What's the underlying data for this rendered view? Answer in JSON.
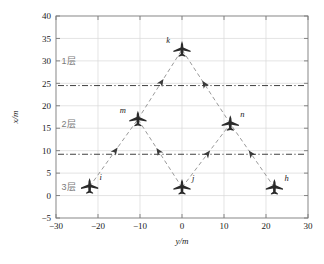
{
  "chart_data": {
    "type": "scatter",
    "title": "",
    "xlabel": "y/m",
    "ylabel": "x/m",
    "xlim": [
      -30,
      30
    ],
    "ylim": [
      -5,
      40
    ],
    "xticks": [
      -30,
      -20,
      -10,
      0,
      10,
      20,
      30
    ],
    "xticklabels": [
      "−30",
      "−20",
      "−10",
      "0",
      "10",
      "20",
      "30"
    ],
    "yticks": [
      -5,
      0,
      5,
      10,
      15,
      20,
      25,
      30,
      35,
      40
    ],
    "yticklabels": [
      "−5",
      "0",
      "5",
      "10",
      "15",
      "20",
      "25",
      "30",
      "35",
      "40"
    ],
    "grid": true,
    "legend": "none",
    "aircraft": [
      {
        "id": "k",
        "label": "k",
        "y": 0.0,
        "x": 32.5,
        "layer": 1,
        "label_side": "left"
      },
      {
        "id": "m",
        "label": "m",
        "y": -10.5,
        "x": 17.0,
        "layer": 2,
        "label_side": "left"
      },
      {
        "id": "n",
        "label": "n",
        "y": 11.5,
        "x": 16.0,
        "layer": 2,
        "label_side": "right"
      },
      {
        "id": "i",
        "label": "i",
        "y": -22.0,
        "x": 2.0,
        "layer": 3,
        "label_side": "right"
      },
      {
        "id": "j",
        "label": "j",
        "y": 0.0,
        "x": 1.8,
        "layer": 3,
        "label_side": "right"
      },
      {
        "id": "h",
        "label": "h",
        "y": 22.0,
        "x": 1.8,
        "layer": 3,
        "label_side": "right"
      }
    ],
    "trajectories": [
      {
        "from": "i",
        "to": "m"
      },
      {
        "from": "j",
        "to": "m"
      },
      {
        "from": "j",
        "to": "n"
      },
      {
        "from": "h",
        "to": "n"
      },
      {
        "from": "m",
        "to": "k"
      },
      {
        "from": "n",
        "to": "k"
      }
    ],
    "reference_lines": [
      {
        "name": "layer-1-2-boundary",
        "x": 24.5,
        "style": "dash-dot",
        "color": "#2b2b2b"
      },
      {
        "name": "layer-2-3-boundary",
        "x": 9.2,
        "style": "dash-dot",
        "color": "#2b2b2b"
      }
    ],
    "layer_labels": [
      {
        "text": "1层",
        "y": -27.0,
        "x": 30.0
      },
      {
        "text": "2层",
        "y": -27.0,
        "x": 16.0
      },
      {
        "text": "3层",
        "y": -27.0,
        "x": 2.0
      }
    ],
    "colors": {
      "grid": "#d9d9d9",
      "frame": "#7a7a7a",
      "trajectory": "#9a9a9a",
      "reference_line": "#2b2b2b",
      "aircraft": "#2a2a2a",
      "layer_label": "#7a7a7a",
      "axis_text": "#1a1a1a",
      "background": "#ffffff"
    }
  }
}
